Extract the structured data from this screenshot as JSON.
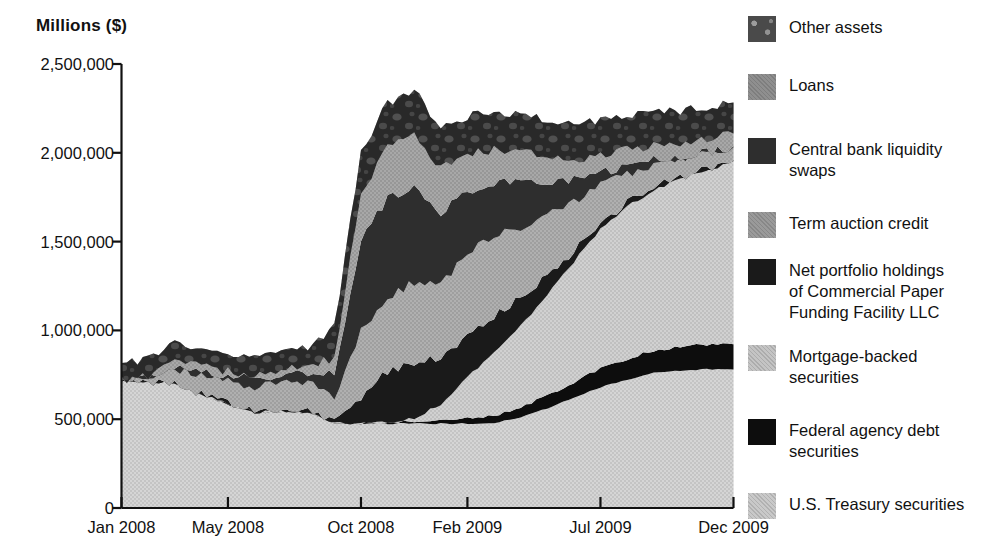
{
  "chart_data": {
    "type": "area",
    "stacked": true,
    "title": "",
    "ylabel": "Millions ($)",
    "xlabel": "",
    "ylim": [
      0,
      2500000
    ],
    "yticks": [
      0,
      500000,
      1000000,
      1500000,
      2000000,
      2500000
    ],
    "ytick_labels": [
      "0",
      "500,000",
      "1,000,000",
      "1,500,000",
      "2,000,000",
      "2,500,000"
    ],
    "grid": false,
    "legend_position": "right",
    "xtick_labels": [
      "Jan 2008",
      "May 2008",
      "Oct 2008",
      "Feb 2009",
      "Jul 2009",
      "Dec 2009"
    ],
    "xtick_index": [
      0,
      4,
      9,
      13,
      18,
      23
    ],
    "x": [
      "Jan 2008",
      "Feb 2008",
      "Mar 2008",
      "Apr 2008",
      "May 2008",
      "Jun 2008",
      "Jul 2008",
      "Aug 2008",
      "Sep 2008",
      "Oct 2008",
      "Nov 2008",
      "Dec 2008",
      "Jan 2009",
      "Feb 2009",
      "Mar 2009",
      "Apr 2009",
      "May 2009",
      "Jun 2009",
      "Jul 2009",
      "Aug 2009",
      "Sep 2009",
      "Oct 2009",
      "Nov 2009",
      "Dec 2009"
    ],
    "series": [
      {
        "name": "U.S. Treasury securities",
        "color": "#c9c9c9",
        "texture": "fine",
        "values": [
          715000,
          710000,
          705000,
          640000,
          585000,
          540000,
          540000,
          540000,
          480000,
          476000,
          476000,
          476000,
          475000,
          475000,
          480000,
          510000,
          560000,
          620000,
          680000,
          720000,
          760000,
          775000,
          780000,
          780000
        ]
      },
      {
        "name": "Federal agency debt securities",
        "color": "#0d0d0d",
        "texture": "solid",
        "values": [
          0,
          0,
          0,
          0,
          0,
          0,
          0,
          0,
          0,
          2000,
          8000,
          15000,
          22000,
          30000,
          40000,
          55000,
          72000,
          88000,
          103000,
          118000,
          128000,
          136000,
          140000,
          142000
        ]
      },
      {
        "name": "Mortgage-backed securities",
        "color": "#c4c4c4",
        "texture": "fine",
        "values": [
          0,
          0,
          0,
          0,
          0,
          0,
          0,
          0,
          0,
          0,
          0,
          12000,
          90000,
          230000,
          350000,
          460000,
          570000,
          680000,
          790000,
          860000,
          900000,
          940000,
          980000,
          1030000
        ]
      },
      {
        "name": "Net portfolio holdings of Commercial Paper Funding Facility LLC",
        "color": "#1a1a1a",
        "texture": "solid",
        "values": [
          0,
          0,
          0,
          0,
          0,
          0,
          0,
          0,
          0,
          145000,
          285000,
          320000,
          250000,
          240000,
          215000,
          160000,
          110000,
          60000,
          30000,
          20000,
          15000,
          12000,
          10000,
          8000
        ]
      },
      {
        "name": "Term auction credit",
        "color": "#9a9a9a",
        "texture": "fine",
        "values": [
          0,
          30000,
          80000,
          110000,
          125000,
          140000,
          155000,
          160000,
          150000,
          375000,
          415000,
          450000,
          415000,
          470000,
          440000,
          400000,
          340000,
          280000,
          215000,
          165000,
          125000,
          95000,
          80000,
          70000
        ]
      },
      {
        "name": "Central bank liquidity swaps",
        "color": "#2e2e2e",
        "texture": "solid",
        "values": [
          0,
          0,
          25000,
          30000,
          35000,
          45000,
          55000,
          62000,
          125000,
          520000,
          555000,
          545000,
          415000,
          330000,
          300000,
          255000,
          190000,
          120000,
          70000,
          45000,
          30000,
          20000,
          12000,
          8000
        ]
      },
      {
        "name": "Loans",
        "color": "#8f8f8f",
        "texture": "fine",
        "values": [
          0,
          5000,
          15000,
          20000,
          25000,
          30000,
          35000,
          40000,
          85000,
          260000,
          290000,
          295000,
          240000,
          215000,
          195000,
          165000,
          140000,
          115000,
          100000,
          90000,
          82000,
          78000,
          74000,
          70000
        ]
      },
      {
        "name": "Other assets",
        "color": "#4a4a4a",
        "texture": "mottled",
        "values": [
          100000,
          98000,
          96000,
          95000,
          95000,
          95000,
          96000,
          96000,
          180000,
          230000,
          250000,
          245000,
          225000,
          215000,
          210000,
          205000,
          200000,
          195000,
          190000,
          185000,
          182000,
          180000,
          178000,
          175000
        ]
      }
    ]
  },
  "legend": {
    "items": [
      {
        "label": "Other assets",
        "color": "#4a4a4a",
        "texture": "mottled"
      },
      {
        "label": "Loans",
        "color": "#8f8f8f",
        "texture": "fine"
      },
      {
        "label": "Central bank liquidity\nswaps",
        "color": "#2e2e2e",
        "texture": "solid"
      },
      {
        "label": "Term auction credit",
        "color": "#9a9a9a",
        "texture": "fine"
      },
      {
        "label": "Net portfolio holdings\nof Commercial Paper\nFunding Facility LLC",
        "color": "#1a1a1a",
        "texture": "solid"
      },
      {
        "label": "Mortgage-backed\nsecurities",
        "color": "#c4c4c4",
        "texture": "fine"
      },
      {
        "label": "Federal agency debt\nsecurities",
        "color": "#0d0d0d",
        "texture": "solid"
      },
      {
        "label": "U.S. Treasury securities",
        "color": "#c9c9c9",
        "texture": "fine"
      }
    ]
  }
}
